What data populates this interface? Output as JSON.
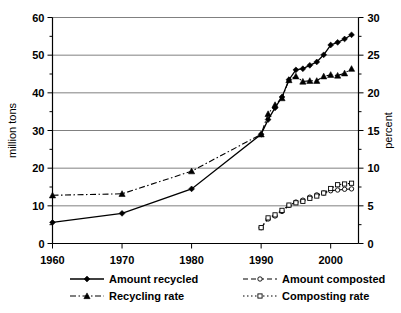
{
  "chart_data": {
    "type": "line",
    "title": "",
    "xlabel": "",
    "ylabel": "million tons",
    "y2label": "percent",
    "xlim": [
      1960,
      2004
    ],
    "ylim": [
      0,
      60
    ],
    "y2lim": [
      0,
      30
    ],
    "xticks": [
      1960,
      1970,
      1980,
      1990,
      2000
    ],
    "xticklabels": [
      "1960",
      "1970",
      "1980",
      "1990",
      "2000"
    ],
    "yticks": [
      0,
      10,
      20,
      30,
      40,
      50,
      60
    ],
    "yticklabels": [
      "0",
      "10",
      "20",
      "30",
      "40",
      "50",
      "60"
    ],
    "y2ticks": [
      0,
      5,
      10,
      15,
      20,
      25,
      30
    ],
    "y2ticklabels": [
      "0",
      "5",
      "10",
      "15",
      "20",
      "25",
      "30"
    ],
    "grid": true,
    "legend_position": "bottom",
    "series": [
      {
        "name": "Amount recycled",
        "axis": "left",
        "unit": "million tons",
        "marker": "filled-diamond",
        "linestyle": "solid",
        "x": [
          1960,
          1970,
          1980,
          1990,
          1991,
          1992,
          1993,
          1994,
          1995,
          1996,
          1997,
          1998,
          1999,
          2000,
          2001,
          2002,
          2003
        ],
        "values": [
          5.6,
          8.0,
          14.5,
          29.0,
          32.9,
          36.0,
          38.9,
          43.5,
          46.1,
          46.4,
          47.3,
          48.2,
          50.1,
          52.7,
          53.4,
          54.3,
          55.4
        ]
      },
      {
        "name": "Recycling rate",
        "axis": "right",
        "unit": "percent",
        "marker": "filled-triangle",
        "linestyle": "dash-dot",
        "x": [
          1960,
          1970,
          1980,
          1990,
          1991,
          1992,
          1993,
          1994,
          1995,
          1996,
          1997,
          1998,
          1999,
          2000,
          2001,
          2002,
          2003
        ],
        "values": [
          6.4,
          6.6,
          9.6,
          14.5,
          17.2,
          18.4,
          19.3,
          21.7,
          22.2,
          21.5,
          21.6,
          21.6,
          22.2,
          22.4,
          22.3,
          22.6,
          23.2
        ]
      },
      {
        "name": "Amount composted",
        "axis": "left",
        "unit": "million tons",
        "marker": "open-circle",
        "linestyle": "dashed",
        "x": [
          1990,
          1991,
          1992,
          1993,
          1994,
          1995,
          1996,
          1997,
          1998,
          1999,
          2000,
          2001,
          2002,
          2003
        ],
        "values": [
          4.2,
          6.5,
          7.3,
          8.5,
          10.1,
          11.0,
          11.5,
          12.3,
          12.9,
          13.4,
          14.0,
          14.2,
          14.4,
          14.5
        ]
      },
      {
        "name": "Composting rate",
        "axis": "right",
        "unit": "percent",
        "marker": "open-square",
        "linestyle": "dotted",
        "x": [
          1990,
          1991,
          1992,
          1993,
          1994,
          1995,
          1996,
          1997,
          1998,
          1999,
          2000,
          2001,
          2002,
          2003
        ],
        "values": [
          2.1,
          3.4,
          3.8,
          4.4,
          5.1,
          5.4,
          5.6,
          6.0,
          6.3,
          6.7,
          7.3,
          7.8,
          7.9,
          8.0
        ]
      }
    ],
    "legend": [
      {
        "label": "Amount recycled",
        "marker": "filled-diamond",
        "linestyle": "solid"
      },
      {
        "label": "Amount composted",
        "marker": "open-circle",
        "linestyle": "dashed"
      },
      {
        "label": "Recycling rate",
        "marker": "filled-triangle",
        "linestyle": "dash-dot"
      },
      {
        "label": "Composting rate",
        "marker": "open-square",
        "linestyle": "dotted"
      }
    ]
  }
}
